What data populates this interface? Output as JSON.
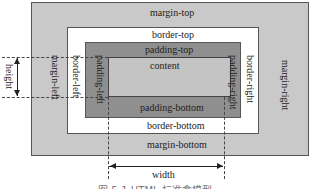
{
  "diagram": {
    "type": "css-box-model",
    "layers": {
      "margin": {
        "top": "margin-top",
        "bottom": "margin-bottom",
        "left": "margin-left",
        "right": "margin-right",
        "fill": "#c9c9c9"
      },
      "border": {
        "top": "border-top",
        "bottom": "border-bottom",
        "left": "border-left",
        "right": "border-right",
        "fill": "#ffffff"
      },
      "padding": {
        "top": "padding-top",
        "bottom": "padding-bottom",
        "left": "padding-left",
        "right": "padding-right",
        "fill": "#8f8f8f"
      },
      "content": {
        "label": "content",
        "fill": "#c4c4c4"
      }
    },
    "dimensions": {
      "width": "width",
      "height": "height"
    },
    "caption": "图 5-1 HTML 标准盒模型"
  }
}
